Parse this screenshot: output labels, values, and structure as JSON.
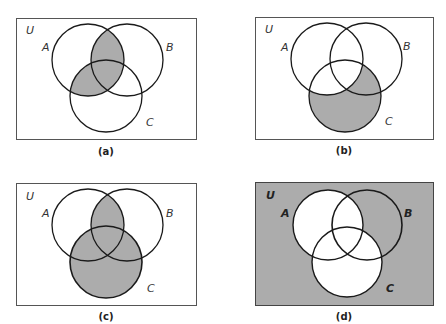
{
  "figure": {
    "shade_color": "#acacac",
    "stroke_color": "#1a1a1a",
    "frame_color": "#555555",
    "panels": [
      {
        "id": "a",
        "caption": "(a)",
        "universe_label": "U",
        "set_labels": [
          "A",
          "B",
          "C"
        ],
        "shaded_region": "A ∩ (B ∪ C)",
        "origin": [
          16,
          18
        ]
      },
      {
        "id": "b",
        "caption": "(b)",
        "universe_label": "U",
        "set_labels": [
          "A",
          "B",
          "C"
        ],
        "shaded_region": "C − A",
        "origin": [
          255,
          17
        ]
      },
      {
        "id": "c",
        "caption": "(c)",
        "universe_label": "U",
        "set_labels": [
          "A",
          "B",
          "C"
        ],
        "shaded_region": "(A ∩ B) ∪ C",
        "origin": [
          16,
          183
        ]
      },
      {
        "id": "d",
        "caption": "(d)",
        "universe_label": "U",
        "set_labels": [
          "A",
          "B",
          "C"
        ],
        "shaded_region": "(A ∪ C)′",
        "origin": [
          255,
          182
        ]
      }
    ]
  }
}
